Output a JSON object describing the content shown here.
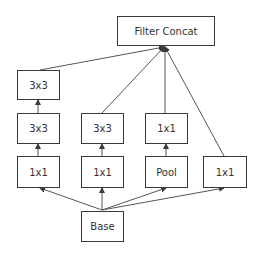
{
  "diagram": {
    "nodes": {
      "concat": {
        "label": "Filter Concat"
      },
      "c1_top": {
        "label": "3x3"
      },
      "c1_mid": {
        "label": "3x3"
      },
      "c1_bot": {
        "label": "1x1"
      },
      "c2_mid": {
        "label": "3x3"
      },
      "c2_bot": {
        "label": "1x1"
      },
      "c3_mid": {
        "label": "1x1"
      },
      "c3_bot": {
        "label": "Pool"
      },
      "c4_bot": {
        "label": "1x1"
      },
      "base": {
        "label": "Base"
      }
    },
    "edges": [
      [
        "base",
        "c1_bot"
      ],
      [
        "base",
        "c2_bot"
      ],
      [
        "base",
        "c3_bot"
      ],
      [
        "base",
        "c4_bot"
      ],
      [
        "c1_bot",
        "c1_mid"
      ],
      [
        "c1_mid",
        "c1_top"
      ],
      [
        "c2_bot",
        "c2_mid"
      ],
      [
        "c3_bot",
        "c3_mid"
      ],
      [
        "c1_top",
        "concat"
      ],
      [
        "c2_mid",
        "concat"
      ],
      [
        "c3_mid",
        "concat"
      ],
      [
        "c4_bot",
        "concat"
      ]
    ],
    "colors": {
      "stroke": "#3a3a3a",
      "text": "#333333",
      "background": "#ffffff"
    }
  }
}
